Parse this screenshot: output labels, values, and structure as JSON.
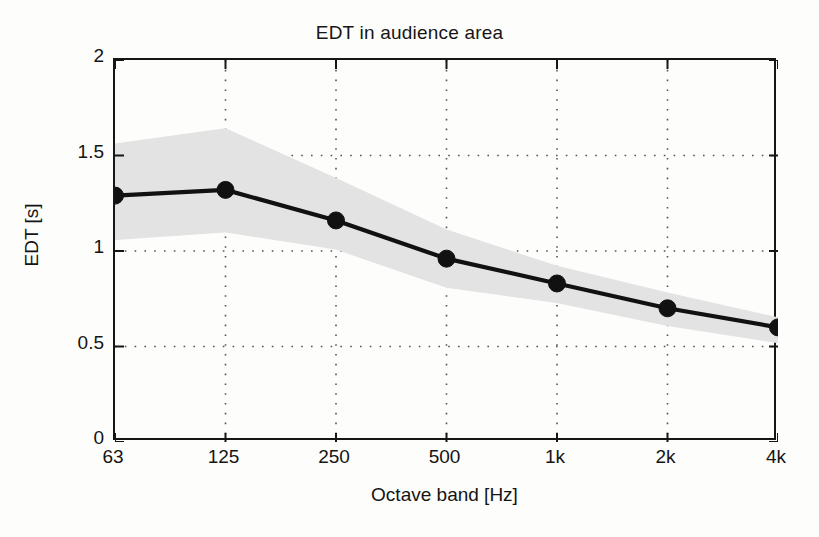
{
  "chart_data": {
    "type": "line",
    "title": "EDT in audience area",
    "xlabel": "Octave band [Hz]",
    "ylabel": "EDT [s]",
    "categories": [
      "63",
      "125",
      "250",
      "500",
      "1k",
      "2k",
      "4k"
    ],
    "x_tick_labels": [
      "63",
      "125",
      "250",
      "500",
      "1k",
      "2k",
      "4k"
    ],
    "y_tick_labels": [
      "0",
      "0.5",
      "1",
      "1.5",
      "2"
    ],
    "y_ticks": [
      0,
      0.5,
      1,
      1.5,
      2
    ],
    "ylim": [
      0,
      2
    ],
    "grid": "dotted",
    "legend": "none",
    "series": [
      {
        "name": "EDT mean",
        "values": [
          1.29,
          1.32,
          1.16,
          0.96,
          0.83,
          0.7,
          0.6
        ],
        "marker": "filled-circle",
        "color": "#111111"
      }
    ],
    "band": {
      "name": "EDT spread",
      "upper": [
        1.56,
        1.64,
        1.38,
        1.11,
        0.92,
        0.78,
        0.65
      ],
      "lower": [
        1.06,
        1.1,
        1.01,
        0.81,
        0.73,
        0.61,
        0.52
      ],
      "color": "#e3e3e3"
    }
  },
  "figure": {
    "background_color": "#fdfdfc",
    "axis_color": "#161616",
    "grid_color": "#555555"
  }
}
